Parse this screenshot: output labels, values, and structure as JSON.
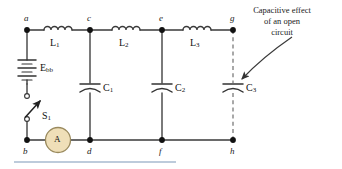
{
  "figure": {
    "kind": "circuit-diagram",
    "annotation": {
      "lines": [
        "Capacitive effect",
        "of an open",
        "circuit"
      ],
      "pointer": "curved-arrow"
    }
  },
  "nodes": {
    "top": [
      {
        "id": "a",
        "label": "a",
        "x": 27,
        "y": 30
      },
      {
        "id": "c",
        "label": "c",
        "x": 90,
        "y": 30
      },
      {
        "id": "e",
        "label": "e",
        "x": 162,
        "y": 30
      },
      {
        "id": "g",
        "label": "g",
        "x": 233,
        "y": 30
      }
    ],
    "bottom": [
      {
        "id": "b",
        "label": "b",
        "x": 27,
        "y": 140
      },
      {
        "id": "d",
        "label": "d",
        "x": 90,
        "y": 140
      },
      {
        "id": "f",
        "label": "f",
        "x": 162,
        "y": 140
      },
      {
        "id": "h",
        "label": "h",
        "x": 233,
        "y": 140
      }
    ]
  },
  "components": {
    "inductors": [
      {
        "name": "L",
        "sub": "1",
        "between": "a-c",
        "x": 58,
        "y": 30
      },
      {
        "name": "L",
        "sub": "2",
        "between": "c-e",
        "x": 126,
        "y": 30
      },
      {
        "name": "L",
        "sub": "3",
        "between": "e-g",
        "x": 197,
        "y": 30
      }
    ],
    "capacitors": [
      {
        "name": "C",
        "sub": "1",
        "between": "c-d",
        "x": 90,
        "y": 88,
        "dashed": false
      },
      {
        "name": "C",
        "sub": "2",
        "between": "e-f",
        "x": 162,
        "y": 88,
        "dashed": false
      },
      {
        "name": "C",
        "sub": "3",
        "between": "g-h",
        "x": 233,
        "y": 88,
        "dashed": true
      }
    ],
    "source": {
      "name": "E",
      "sub": "bb",
      "type": "battery",
      "between": "a-b",
      "x": 27,
      "y": 72
    },
    "switch": {
      "name": "S",
      "sub": "1",
      "state": "open",
      "x": 27,
      "y": 108
    },
    "meter": {
      "name": "A",
      "type": "ammeter",
      "between": "b-d",
      "x": 58,
      "y": 140
    }
  },
  "colors": {
    "wire": "#3a3a3a",
    "dashed_wire": "#8c8c8c",
    "node_fill": "#111111",
    "meter_fill": "#efdfb8",
    "meter_stroke": "#9a8a5e",
    "rule": "#7d97b8",
    "text": "#1a1a1a"
  }
}
